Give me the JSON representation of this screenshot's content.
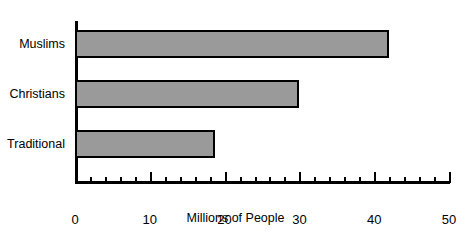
{
  "chart_data": {
    "type": "bar",
    "orientation": "horizontal",
    "title": "",
    "subtitle": "",
    "xlabel": "Millions of People",
    "ylabel": "",
    "categories": [
      "Muslims",
      "Christians",
      "Traditional"
    ],
    "values": [
      42,
      30,
      18.7
    ],
    "series": [
      {
        "name": "Millions of People",
        "values": [
          42,
          30,
          18.7
        ]
      }
    ],
    "xlim": [
      0,
      50
    ],
    "xticks": [
      0,
      10,
      20,
      30,
      40,
      50
    ],
    "xtick_labels": [
      "0",
      "10",
      "20",
      "30",
      "40",
      "50"
    ],
    "minor_tick_step": 2,
    "grid": false,
    "legend": false,
    "legend_position": "none",
    "bar_fill_color": "#9a9a9a",
    "bar_edge_color": "#000000",
    "axis_color": "#000000",
    "background_color": "#ffffff"
  },
  "figure": {
    "clipped_title": ""
  }
}
